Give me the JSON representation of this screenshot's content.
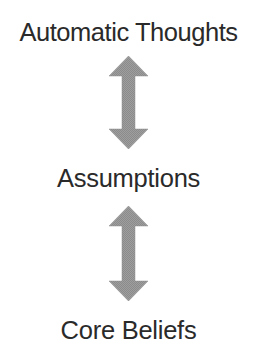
{
  "diagram": {
    "type": "vertical-flow",
    "background_color": "#ffffff",
    "text_color": "#2a2a2a",
    "arrow_color": "#9a9a9a",
    "levels": [
      {
        "id": "automatic-thoughts",
        "label": "Automatic Thoughts"
      },
      {
        "id": "assumptions",
        "label": "Assumptions"
      },
      {
        "id": "core-beliefs",
        "label": "Core Beliefs"
      }
    ],
    "connectors": [
      {
        "id": "thoughts-assumptions",
        "icon": "double-headed-vertical-arrow-icon",
        "from": "Automatic Thoughts",
        "to": "Assumptions",
        "direction": "bidirectional"
      },
      {
        "id": "assumptions-beliefs",
        "icon": "double-headed-vertical-arrow-icon",
        "from": "Assumptions",
        "to": "Core Beliefs",
        "direction": "bidirectional"
      }
    ]
  }
}
